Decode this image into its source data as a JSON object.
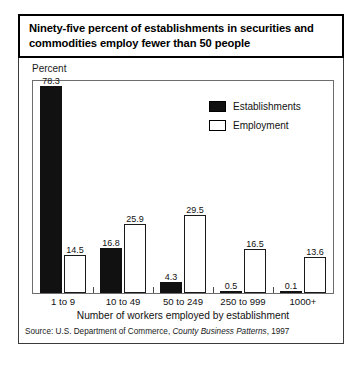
{
  "title": "Ninety-five percent of establishments in securities and commodities employ fewer than 50 people",
  "y_axis_caption": "Percent",
  "x_axis_title": "Number of workers employed by establishment",
  "source": {
    "prefix": "Source: U.S. Department of Commerce, ",
    "italic": "County Business Patterns",
    "suffix": ", 1997"
  },
  "legend": {
    "items": [
      {
        "label": "Establishments",
        "style": "filled",
        "color": "#111111"
      },
      {
        "label": "Employment",
        "style": "hollow",
        "color": "#ffffff"
      }
    ]
  },
  "chart_data": {
    "type": "bar",
    "title": "Ninety-five percent of establishments in securities and commodities employ fewer than 50 people",
    "xlabel": "Number of workers employed by establishment",
    "ylabel": "Percent",
    "ylim": [
      0,
      80
    ],
    "grid": false,
    "legend_position": "top-right",
    "categories": [
      "1 to 9",
      "10 to 49",
      "50 to 249",
      "250 to 999",
      "1000+"
    ],
    "series": [
      {
        "name": "Establishments",
        "style": "filled",
        "values": [
          78.3,
          16.8,
          4.3,
          0.5,
          0.1
        ],
        "labels": [
          "78.3",
          "16.8",
          "4.3",
          "0.5",
          "0.1"
        ]
      },
      {
        "name": "Employment",
        "style": "hollow",
        "values": [
          14.5,
          25.9,
          29.5,
          16.5,
          13.6
        ],
        "labels": [
          "14.5",
          "25.9",
          "29.5",
          "16.5",
          "13.6"
        ]
      }
    ],
    "source": "Source: U.S. Department of Commerce, County Business Patterns, 1997"
  }
}
